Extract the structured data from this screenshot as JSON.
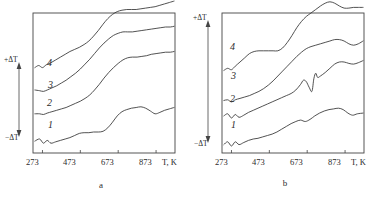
{
  "figure": {
    "background_color": "#ffffff",
    "line_color": "#333333"
  },
  "chart_data": [
    {
      "type": "line",
      "panel_label": "a",
      "title": "",
      "xlabel": "T, K",
      "ylabel_top": "+ΔT",
      "ylabel_bottom": "−ΔT",
      "xlim": [
        223,
        973
      ],
      "xticks": [
        273,
        473,
        673,
        873
      ],
      "xticklabels": [
        "273",
        "473",
        "673",
        "873"
      ],
      "ylim": [
        -1,
        1
      ],
      "grid": false,
      "legend": "inline-curve-numbers",
      "series": [
        {
          "name": "1",
          "label": "1",
          "x": [
            233,
            258,
            278,
            298,
            318,
            343,
            368,
            393,
            418,
            443,
            468,
            493,
            518,
            543,
            568,
            593,
            618,
            643,
            668,
            693,
            718,
            743,
            768,
            793,
            818,
            843,
            868,
            893,
            918,
            943,
            968
          ],
          "y": [
            -0.83,
            -0.8,
            -0.86,
            -0.82,
            -0.86,
            -0.84,
            -0.82,
            -0.8,
            -0.78,
            -0.75,
            -0.72,
            -0.71,
            -0.71,
            -0.7,
            -0.7,
            -0.69,
            -0.64,
            -0.56,
            -0.47,
            -0.41,
            -0.38,
            -0.36,
            -0.35,
            -0.34,
            -0.36,
            -0.4,
            -0.44,
            -0.42,
            -0.39,
            -0.37,
            -0.35
          ]
        },
        {
          "name": "2",
          "label": "2",
          "x": [
            233,
            258,
            278,
            298,
            323,
            348,
            373,
            398,
            423,
            448,
            473,
            498,
            523,
            548,
            573,
            598,
            623,
            648,
            673,
            698,
            723,
            748,
            773,
            798,
            823,
            848,
            873,
            898,
            923,
            948,
            968
          ],
          "y": [
            -0.44,
            -0.44,
            -0.45,
            -0.43,
            -0.41,
            -0.39,
            -0.37,
            -0.35,
            -0.32,
            -0.29,
            -0.26,
            -0.22,
            -0.17,
            -0.1,
            -0.02,
            0.07,
            0.15,
            0.22,
            0.28,
            0.33,
            0.36,
            0.37,
            0.37,
            0.38,
            0.39,
            0.41,
            0.42,
            0.43,
            0.44,
            0.44,
            0.45
          ]
        },
        {
          "name": "3",
          "label": "3",
          "x": [
            233,
            258,
            278,
            298,
            323,
            348,
            373,
            398,
            423,
            448,
            473,
            498,
            523,
            548,
            573,
            598,
            623,
            648,
            673,
            698,
            723,
            748,
            773,
            798,
            823,
            848,
            873,
            898,
            923,
            948,
            968
          ],
          "y": [
            -0.1,
            -0.11,
            -0.12,
            -0.1,
            -0.07,
            -0.04,
            0.0,
            0.04,
            0.09,
            0.14,
            0.2,
            0.27,
            0.34,
            0.42,
            0.5,
            0.57,
            0.63,
            0.68,
            0.71,
            0.73,
            0.73,
            0.73,
            0.74,
            0.75,
            0.76,
            0.77,
            0.78,
            0.79,
            0.8,
            0.8,
            0.81
          ]
        },
        {
          "name": "4",
          "label": "4",
          "x": [
            233,
            253,
            273,
            293,
            318,
            343,
            368,
            393,
            418,
            443,
            468,
            493,
            518,
            543,
            568,
            593,
            618,
            643,
            668,
            693,
            718,
            743,
            768,
            793,
            818,
            843,
            868,
            893,
            918,
            943,
            968
          ],
          "y": [
            0.22,
            0.25,
            0.22,
            0.26,
            0.29,
            0.33,
            0.37,
            0.41,
            0.45,
            0.48,
            0.51,
            0.55,
            0.6,
            0.67,
            0.75,
            0.84,
            0.92,
            0.98,
            1.02,
            1.04,
            1.05,
            1.05,
            1.05,
            1.06,
            1.07,
            1.08,
            1.09,
            1.11,
            1.13,
            1.15,
            1.17
          ]
        }
      ]
    },
    {
      "type": "line",
      "panel_label": "b",
      "title": "",
      "xlabel": "T, K",
      "ylabel_top": "+ΔT",
      "ylabel_bottom": "−ΔT",
      "xlim": [
        223,
        973
      ],
      "xticks": [
        273,
        473,
        673,
        873
      ],
      "xticklabels": [
        "273",
        "473",
        "673",
        "873"
      ],
      "ylim": [
        -1,
        1
      ],
      "grid": false,
      "legend": "inline-curve-numbers",
      "series": [
        {
          "name": "1",
          "label": "1",
          "x": [
            233,
            253,
            273,
            293,
            313,
            338,
            363,
            388,
            413,
            438,
            463,
            488,
            513,
            538,
            563,
            588,
            613,
            638,
            663,
            688,
            713,
            738,
            763,
            788,
            813,
            838,
            863,
            888,
            913,
            938,
            968
          ],
          "y": [
            -0.88,
            -0.84,
            -0.9,
            -0.84,
            -0.88,
            -0.85,
            -0.82,
            -0.8,
            -0.79,
            -0.77,
            -0.75,
            -0.73,
            -0.7,
            -0.66,
            -0.62,
            -0.58,
            -0.55,
            -0.53,
            -0.55,
            -0.52,
            -0.47,
            -0.43,
            -0.4,
            -0.38,
            -0.37,
            -0.36,
            -0.38,
            -0.43,
            -0.46,
            -0.44,
            -0.43
          ]
        },
        {
          "name": "2",
          "label": "2",
          "x": [
            233,
            253,
            273,
            293,
            313,
            338,
            363,
            388,
            413,
            438,
            463,
            488,
            513,
            538,
            563,
            588,
            613,
            638,
            653,
            668,
            683,
            698,
            708,
            718,
            728,
            743,
            768,
            793,
            818,
            843,
            868,
            893,
            918,
            943,
            968
          ],
          "y": [
            -0.47,
            -0.44,
            -0.5,
            -0.45,
            -0.49,
            -0.46,
            -0.42,
            -0.39,
            -0.36,
            -0.33,
            -0.3,
            -0.27,
            -0.24,
            -0.21,
            -0.18,
            -0.15,
            -0.1,
            -0.02,
            0.04,
            0.02,
            -0.06,
            -0.12,
            0.06,
            0.14,
            0.08,
            0.1,
            0.15,
            0.21,
            0.27,
            0.3,
            0.3,
            0.28,
            0.27,
            0.29,
            0.32
          ]
        },
        {
          "name": "3",
          "label": "3",
          "x": [
            233,
            253,
            273,
            293,
            318,
            343,
            368,
            393,
            418,
            443,
            468,
            493,
            518,
            543,
            568,
            593,
            618,
            643,
            668,
            693,
            718,
            743,
            768,
            793,
            818,
            843,
            868,
            893,
            918,
            943,
            968
          ],
          "y": [
            -0.25,
            -0.24,
            -0.27,
            -0.24,
            -0.22,
            -0.2,
            -0.18,
            -0.15,
            -0.12,
            -0.08,
            -0.03,
            0.03,
            0.1,
            0.17,
            0.24,
            0.31,
            0.38,
            0.44,
            0.49,
            0.52,
            0.54,
            0.56,
            0.58,
            0.6,
            0.62,
            0.62,
            0.6,
            0.56,
            0.54,
            0.56,
            0.6
          ]
        },
        {
          "name": "4",
          "label": "4",
          "x": [
            233,
            253,
            273,
            293,
            318,
            343,
            368,
            393,
            418,
            443,
            468,
            493,
            518,
            543,
            568,
            593,
            618,
            643,
            668,
            693,
            718,
            743,
            768,
            793,
            818,
            843,
            868,
            893,
            918,
            943,
            968
          ],
          "y": [
            0.18,
            0.21,
            0.19,
            0.24,
            0.3,
            0.36,
            0.42,
            0.45,
            0.46,
            0.46,
            0.46,
            0.46,
            0.46,
            0.5,
            0.58,
            0.68,
            0.79,
            0.88,
            0.95,
            1.0,
            1.05,
            1.1,
            1.14,
            1.16,
            1.14,
            1.1,
            1.07,
            1.07,
            1.08,
            1.08,
            1.08
          ]
        }
      ]
    }
  ],
  "panel_a": {
    "caption": "a",
    "axis_name": "T, K",
    "y_top": "+ΔT",
    "y_bottom": "−ΔT",
    "ticks": [
      "273",
      "473",
      "673",
      "873"
    ],
    "curve_labels": [
      "1",
      "2",
      "3",
      "4"
    ]
  },
  "panel_b": {
    "caption": "b",
    "axis_name": "T, K",
    "y_top": "+ΔT",
    "y_bottom": "−ΔT",
    "ticks": [
      "273",
      "473",
      "673",
      "873"
    ],
    "curve_labels": [
      "1",
      "2",
      "3",
      "4"
    ]
  }
}
